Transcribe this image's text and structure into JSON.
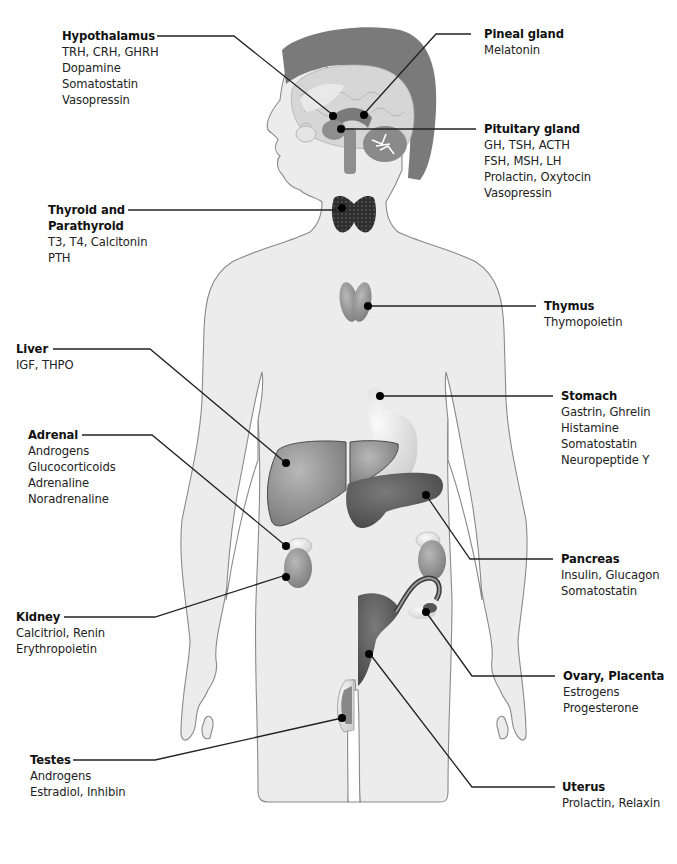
{
  "colors": {
    "body_fill": "#ececec",
    "body_stroke": "#8a8a8a",
    "skull": "#7a7a7a",
    "brain": "#d4d4d4",
    "organ_mid": "#8e8e8e",
    "organ_dark": "#5e5e5e",
    "thyroid": "#333333",
    "leader_line": "#222222",
    "dot": "#000000"
  },
  "labels": {
    "hypothalamus": {
      "title": "Hypothalamus",
      "hormones": [
        "TRH, CRH, GHRH",
        "Dopamine",
        "Somatostatin",
        "Vasopressin"
      ]
    },
    "pineal": {
      "title": "Pineal gland",
      "hormones": [
        "Melatonin"
      ]
    },
    "pituitary": {
      "title": "Pituitary gland",
      "hormones": [
        "GH, TSH, ACTH",
        "FSH, MSH, LH",
        "Prolactin, Oxytocin",
        "Vasopressin"
      ]
    },
    "thyroid": {
      "title_line1": "Thyroid and",
      "title_line2": "Parathyroid",
      "hormones": [
        "T3, T4, Calcitonin",
        "PTH"
      ]
    },
    "thymus": {
      "title": "Thymus",
      "hormones": [
        "Thymopoietin"
      ]
    },
    "liver": {
      "title": "Liver",
      "hormones": [
        "IGF, THPO"
      ]
    },
    "stomach": {
      "title": "Stomach",
      "hormones": [
        "Gastrin, Ghrelin",
        "Histamine",
        "Somatostatin",
        "Neuropeptide Y"
      ]
    },
    "adrenal": {
      "title": "Adrenal",
      "hormones": [
        "Androgens",
        "Glucocorticoids",
        "Adrenaline",
        "Noradrenaline"
      ]
    },
    "pancreas": {
      "title": "Pancreas",
      "hormones": [
        "Insulin, Glucagon",
        "Somatostatin"
      ]
    },
    "kidney": {
      "title": "Kidney",
      "hormones": [
        "Calcitriol, Renin",
        "Erythropoietin"
      ]
    },
    "ovary": {
      "title": "Ovary, Placenta",
      "hormones": [
        "Estrogens",
        "Progesterone"
      ]
    },
    "testes": {
      "title": "Testes",
      "hormones": [
        "Androgens",
        "Estradiol, Inhibin"
      ]
    },
    "uterus": {
      "title": "Uterus",
      "hormones": [
        "Prolactin, Relaxin"
      ]
    }
  }
}
